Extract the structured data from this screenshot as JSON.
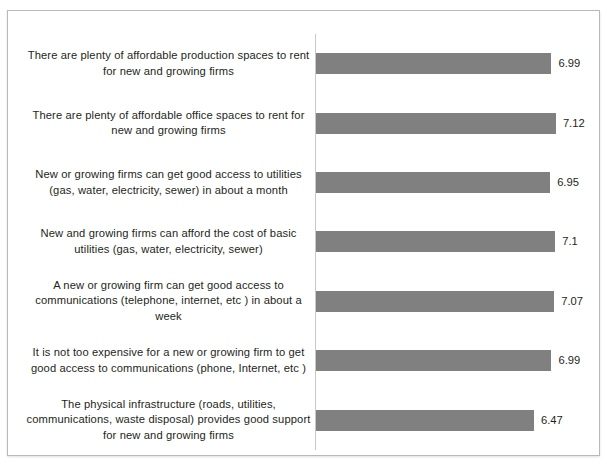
{
  "chart_data": {
    "type": "bar",
    "orientation": "horizontal",
    "title": "",
    "subtitle": "",
    "xlabel": "",
    "ylabel": "",
    "xlim": [
      0,
      8.4
    ],
    "grid": false,
    "legend": false,
    "legend_position": "none",
    "bar_color": "#808080",
    "label_color": "#231f20",
    "axis_color": "#c8c8c8",
    "frame_color": "#b9b9b9",
    "background": "#ffffff",
    "categories": [
      "There are plenty of affordable production spaces to rent for new and growing firms",
      "There are plenty of affordable office spaces to rent for new and growing firms",
      "New or growing firms can get good access to utilities (gas, water, electricity, sewer) in about a month",
      "New and growing firms can afford the cost of basic utilities (gas, water, electricity, sewer)",
      "A new or growing firm can get good access to communications (telephone, internet, etc ) in about a week",
      "It is not too expensive for a new or growing firm to get good access to communications (phone, Internet, etc )",
      "The physical infrastructure (roads, utilities, communications, waste disposal) provides good support for new and growing firms"
    ],
    "values": [
      6.99,
      7.12,
      6.95,
      7.1,
      7.07,
      6.99,
      6.47
    ],
    "value_labels": [
      "6.99",
      "7.12",
      "6.95",
      "7.1",
      "7.07",
      "6.99",
      "6.47"
    ],
    "bars": [
      {
        "category": "There are plenty of affordable production spaces to rent for new and growing firms",
        "value": 6.99,
        "value_label": "6.99"
      },
      {
        "category": "There are plenty of affordable office spaces to rent for new and growing firms",
        "value": 7.12,
        "value_label": "7.12"
      },
      {
        "category": "New or growing firms can get good access to utilities (gas, water, electricity, sewer) in about a month",
        "value": 6.95,
        "value_label": "6.95"
      },
      {
        "category": "New and growing firms can afford the cost of basic utilities (gas, water, electricity, sewer)",
        "value": 7.1,
        "value_label": "7.1"
      },
      {
        "category": "A new or growing firm can get good access to communications (telephone, internet, etc ) in about a week",
        "value": 7.07,
        "value_label": "7.07"
      },
      {
        "category": "It is not too expensive for a new or growing firm to get good access to communications (phone, Internet, etc )",
        "value": 6.99,
        "value_label": "6.99"
      },
      {
        "category": "The physical infrastructure (roads, utilities, communications, waste disposal) provides good support for new and growing firms",
        "value": 6.47,
        "value_label": "6.47"
      }
    ]
  }
}
